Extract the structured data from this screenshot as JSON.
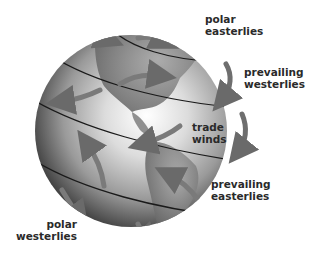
{
  "diagram": {
    "colors": {
      "background": "#ffffff",
      "globe_light": "#f2f2f2",
      "globe_dark": "#4a4a4a",
      "land": "#8c8c8c",
      "latitude_lines": "#1a1a1a",
      "arrows": "#7a7a7a",
      "label_text": "#2a2a2a"
    },
    "labels": {
      "polar_easterlies": {
        "line1": "polar",
        "line2": "easterlies"
      },
      "prevailing_westerlies": {
        "line1": "prevailing",
        "line2": "westerlies"
      },
      "trade_winds": {
        "line1": "trade",
        "line2": "winds"
      },
      "prevailing_easterlies": {
        "line1": "prevailing",
        "line2": "easterlies"
      },
      "polar_westerlies": {
        "line1": "polar",
        "line2": "westerlies"
      }
    },
    "wind_belts": [
      {
        "name": "polar easterlies",
        "hemisphere": "north"
      },
      {
        "name": "prevailing westerlies",
        "hemisphere": "north"
      },
      {
        "name": "trade winds",
        "hemisphere": "north"
      },
      {
        "name": "prevailing easterlies",
        "hemisphere": "south"
      },
      {
        "name": "polar westerlies",
        "hemisphere": "south"
      }
    ]
  }
}
